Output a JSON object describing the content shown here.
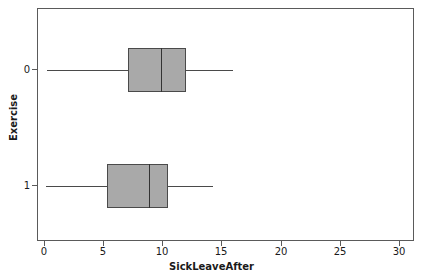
{
  "chart_data": {
    "type": "box",
    "title": "",
    "xlabel": "SickLeaveAfter",
    "ylabel": "Exercise",
    "xlim": [
      0,
      30
    ],
    "x_ticks": [
      0,
      5,
      10,
      15,
      20,
      25,
      30
    ],
    "x_tick_labels": [
      "0",
      "5",
      "10",
      "15",
      "20",
      "25",
      "30"
    ],
    "y_categories": [
      "0",
      "1"
    ],
    "grid": false,
    "legend": null,
    "orientation": "horizontal",
    "boxes": [
      {
        "category": "0",
        "whisker_low": 0.2,
        "q1": 7.0,
        "median": 9.8,
        "q3": 11.9,
        "whisker_high": 15.9,
        "fill": "#a9a9a9",
        "edge": "#4a4a4a"
      },
      {
        "category": "1",
        "whisker_low": 0.1,
        "q1": 5.2,
        "median": 8.8,
        "q3": 10.4,
        "whisker_high": 14.2,
        "fill": "#a9a9a9",
        "edge": "#4a4a4a"
      }
    ]
  },
  "axis": {
    "x_title": "SickLeaveAfter",
    "y_title": "Exercise",
    "x_tick_0": "0",
    "x_tick_1": "5",
    "x_tick_2": "10",
    "x_tick_3": "15",
    "x_tick_4": "20",
    "x_tick_5": "25",
    "x_tick_6": "30",
    "y_tick_0": "0",
    "y_tick_1": "1"
  },
  "colors": {
    "box_fill": "#a9a9a9",
    "box_edge": "#4a4a4a",
    "frame": "#5a5a5a",
    "text": "#1a1a1a",
    "background": "#ffffff"
  }
}
